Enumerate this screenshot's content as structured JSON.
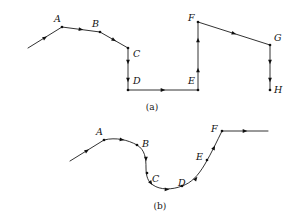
{
  "figure": {
    "width": 294,
    "height": 223,
    "background_color": "#ffffff",
    "stroke_color": "#1b1b1b",
    "marker_color": "#101010",
    "label_color": "#111111"
  },
  "panels": [
    {
      "id": "panel-a",
      "caption": "(a)",
      "caption_x": 152,
      "caption_y": 103,
      "description": "polyline",
      "path_type": "polyline",
      "path_d": "M 28 48 L 62 27 L 100 32 L 128 48 L 128 90 L 198 90 L 198 22 L 270 45 L 270 90",
      "vertices": [
        {
          "label": "A",
          "x": 62,
          "y": 27,
          "label_x": 54,
          "label_y": 14,
          "dot": true
        },
        {
          "label": "B",
          "x": 100,
          "y": 32,
          "label_x": 92,
          "label_y": 19,
          "dot": true
        },
        {
          "label": "C",
          "x": 128,
          "y": 48,
          "label_x": 133,
          "label_y": 49,
          "dot": true
        },
        {
          "label": "D",
          "x": 128,
          "y": 90,
          "label_x": 133,
          "label_y": 76,
          "dot": true
        },
        {
          "label": "E",
          "x": 198,
          "y": 90,
          "label_x": 188,
          "label_y": 76,
          "dot": true
        },
        {
          "label": "F",
          "x": 198,
          "y": 22,
          "label_x": 188,
          "label_y": 13,
          "dot": true
        },
        {
          "label": "G",
          "x": 270,
          "y": 45,
          "label_x": 274,
          "label_y": 33,
          "dot": true
        },
        {
          "label": "H",
          "x": 270,
          "y": 90,
          "label_x": 274,
          "label_y": 85,
          "dot": true
        }
      ],
      "arrows": [
        {
          "x": 45,
          "y": 37.6,
          "angle": -31.7
        },
        {
          "x": 81,
          "y": 29.5,
          "angle": 7.5
        },
        {
          "x": 114,
          "y": 40.0,
          "angle": 29.7
        },
        {
          "x": 128,
          "y": 62,
          "angle": 90
        },
        {
          "x": 128,
          "y": 80,
          "angle": 90
        },
        {
          "x": 163,
          "y": 90,
          "angle": 0
        },
        {
          "x": 198,
          "y": 70,
          "angle": -90
        },
        {
          "x": 198,
          "y": 40,
          "angle": -90
        },
        {
          "x": 234,
          "y": 33.5,
          "angle": 17.7
        },
        {
          "x": 270,
          "y": 62,
          "angle": 90
        },
        {
          "x": 270,
          "y": 80,
          "angle": 90
        }
      ]
    },
    {
      "id": "panel-b",
      "caption": "(b)",
      "caption_x": 160,
      "caption_y": 202,
      "description": "smoothed-curve",
      "path_type": "smooth-curve",
      "path_d": "M 70 161 L 104 140 C 116 137 128 140 137 145 C 145 150 146 158 146 168 C 146 176 148 182 153 185 C 160 190 172 190 182 186 C 191 183 198 176 205 164 C 212 152 217 141 222 131 L 268 131",
      "vertices": [
        {
          "label": "A",
          "x": 104,
          "y": 140,
          "label_x": 96,
          "label_y": 127,
          "dot": true
        },
        {
          "label": "B",
          "x": 137,
          "y": 145,
          "label_x": 142,
          "label_y": 139,
          "dot": true
        },
        {
          "label": "C",
          "x": 147,
          "y": 173,
          "label_x": 152,
          "label_y": 174,
          "dot": true
        },
        {
          "label": "D",
          "x": 182,
          "y": 186,
          "label_x": 178,
          "label_y": 178,
          "dot": true
        },
        {
          "label": "E",
          "x": 207,
          "y": 160,
          "label_x": 196,
          "label_y": 152,
          "dot": true
        },
        {
          "label": "F",
          "x": 222,
          "y": 131,
          "label_x": 211,
          "label_y": 124,
          "dot": true
        }
      ],
      "arrows": [
        {
          "x": 87,
          "y": 150.6,
          "angle": -31.7
        },
        {
          "x": 122,
          "y": 139.6,
          "angle": 8.0
        },
        {
          "x": 146,
          "y": 159,
          "angle": 88.0
        },
        {
          "x": 151,
          "y": 183,
          "angle": 55.0
        },
        {
          "x": 167,
          "y": 189.5,
          "angle": 3.0
        },
        {
          "x": 196,
          "y": 178.5,
          "angle": -53.0
        },
        {
          "x": 214,
          "y": 147.5,
          "angle": -64.0
        },
        {
          "x": 245,
          "y": 131,
          "angle": 0
        }
      ]
    }
  ]
}
